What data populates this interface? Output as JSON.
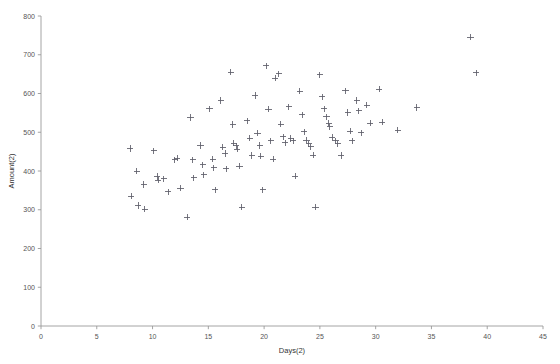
{
  "chart_data": {
    "type": "scatter",
    "title": "",
    "subtitle": "",
    "xlabel": "Days(2)",
    "ylabel": "Amount(2)",
    "xlim": [
      0,
      45
    ],
    "ylim": [
      0,
      800
    ],
    "xticks": [
      0,
      5,
      10,
      15,
      20,
      25,
      30,
      35,
      40,
      45
    ],
    "yticks": [
      0,
      100,
      200,
      300,
      400,
      500,
      600,
      700,
      800
    ],
    "xtick_labels": [
      "0",
      "5",
      "10",
      "15",
      "20",
      "25",
      "30",
      "35",
      "40",
      "45"
    ],
    "ytick_labels": [
      "0",
      "100",
      "200",
      "300",
      "400",
      "500",
      "600",
      "700",
      "800"
    ],
    "grid": false,
    "legend": false,
    "legend_position": "none",
    "marker": "plus",
    "marker_color": "#5d5d68",
    "annotations": [],
    "series": [
      {
        "name": "Amount(2) vs Days(2)",
        "points": [
          [
            8.0,
            458
          ],
          [
            8.1,
            335
          ],
          [
            8.6,
            399
          ],
          [
            8.7,
            311
          ],
          [
            9.2,
            365
          ],
          [
            9.3,
            301
          ],
          [
            10.1,
            452
          ],
          [
            10.4,
            386
          ],
          [
            10.5,
            376
          ],
          [
            11.0,
            380
          ],
          [
            11.4,
            346
          ],
          [
            12.0,
            429
          ],
          [
            12.2,
            433
          ],
          [
            12.5,
            356
          ],
          [
            13.1,
            281
          ],
          [
            13.4,
            538
          ],
          [
            13.6,
            429
          ],
          [
            13.7,
            382
          ],
          [
            14.3,
            466
          ],
          [
            14.5,
            416
          ],
          [
            14.6,
            390
          ],
          [
            15.1,
            561
          ],
          [
            15.4,
            430
          ],
          [
            15.5,
            408
          ],
          [
            15.6,
            352
          ],
          [
            16.1,
            582
          ],
          [
            16.3,
            461
          ],
          [
            16.5,
            445
          ],
          [
            16.6,
            406
          ],
          [
            17.0,
            655
          ],
          [
            17.2,
            520
          ],
          [
            17.3,
            472
          ],
          [
            17.5,
            465
          ],
          [
            17.6,
            456
          ],
          [
            17.8,
            412
          ],
          [
            18.0,
            307
          ],
          [
            18.5,
            530
          ],
          [
            18.7,
            485
          ],
          [
            18.9,
            440
          ],
          [
            19.2,
            595
          ],
          [
            19.4,
            498
          ],
          [
            19.6,
            466
          ],
          [
            19.7,
            438
          ],
          [
            19.9,
            352
          ],
          [
            20.2,
            672
          ],
          [
            20.4,
            560
          ],
          [
            20.6,
            478
          ],
          [
            20.8,
            430
          ],
          [
            21.0,
            640
          ],
          [
            21.3,
            651
          ],
          [
            21.5,
            521
          ],
          [
            21.7,
            488
          ],
          [
            21.9,
            473
          ],
          [
            22.2,
            566
          ],
          [
            22.4,
            484
          ],
          [
            22.6,
            478
          ],
          [
            22.8,
            387
          ],
          [
            23.2,
            606
          ],
          [
            23.4,
            545
          ],
          [
            23.6,
            501
          ],
          [
            23.8,
            480
          ],
          [
            24.0,
            470
          ],
          [
            24.2,
            462
          ],
          [
            24.4,
            441
          ],
          [
            24.6,
            307
          ],
          [
            25.0,
            648
          ],
          [
            25.2,
            592
          ],
          [
            25.4,
            561
          ],
          [
            25.6,
            540
          ],
          [
            25.8,
            523
          ],
          [
            25.9,
            514
          ],
          [
            26.1,
            487
          ],
          [
            26.4,
            478
          ],
          [
            26.6,
            470
          ],
          [
            26.9,
            440
          ],
          [
            27.3,
            607
          ],
          [
            27.5,
            551
          ],
          [
            27.7,
            503
          ],
          [
            27.9,
            478
          ],
          [
            28.3,
            582
          ],
          [
            28.5,
            555
          ],
          [
            28.7,
            499
          ],
          [
            29.2,
            570
          ],
          [
            29.5,
            523
          ],
          [
            30.3,
            611
          ],
          [
            30.6,
            526
          ],
          [
            32.0,
            505
          ],
          [
            33.7,
            564
          ],
          [
            38.5,
            745
          ],
          [
            39.0,
            653
          ]
        ]
      }
    ]
  },
  "axes": {
    "x_axis_name": "x-axis",
    "y_axis_name": "y-axis"
  }
}
